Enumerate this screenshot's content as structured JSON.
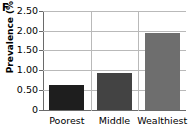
{
  "panel": {
    "letter": "F"
  },
  "chart_data": {
    "type": "bar",
    "title": "",
    "xlabel": "",
    "ylabel": "Prevalence (%)",
    "categories": [
      "Poorest",
      "Middle",
      "Wealthiest"
    ],
    "values": [
      0.62,
      0.92,
      1.95
    ],
    "ylim": [
      0,
      2.5
    ],
    "yticks": [
      0,
      0.5,
      1.0,
      1.5,
      2.0,
      2.5
    ],
    "ytick_labels": [
      "0",
      "0.50",
      "1.00",
      "1.50",
      "2.00",
      "2.50"
    ],
    "grid": true,
    "legend": null,
    "bar_colors": [
      "#1e1e1e",
      "#434343",
      "#6e6e6e"
    ]
  },
  "style": {
    "axis_color": "#6a6a6a",
    "grid_color": "#b9b9b9",
    "text_color": "#000000",
    "background": "#ffffff"
  }
}
